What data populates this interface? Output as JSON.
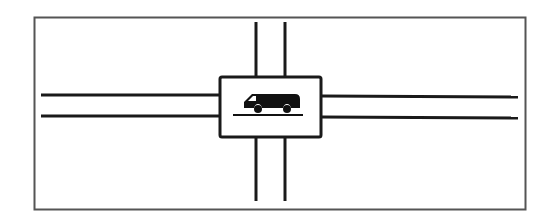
{
  "diagram": {
    "colors": {
      "line": "#1a1a1a",
      "frame": "#555555",
      "background": "#ffffff"
    },
    "frame": {
      "x": 34,
      "y": 17,
      "width": 491,
      "height": 192
    },
    "horizontal_road": {
      "y_top": 95,
      "y_bottom": 116,
      "x_start": 41,
      "x_end": 518
    },
    "vertical_road": {
      "x_left": 256,
      "x_right": 285,
      "y_start": 22,
      "y_end": 201
    },
    "center_box": {
      "x": 219,
      "y": 76,
      "width": 103,
      "height": 62
    },
    "icon": {
      "name": "van-icon"
    }
  }
}
